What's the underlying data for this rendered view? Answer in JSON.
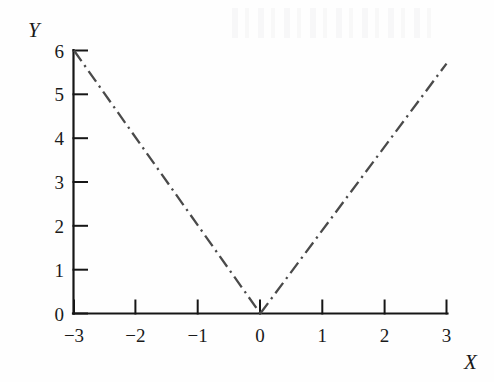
{
  "figure": {
    "background_color": "#fefefe",
    "axis_color": "#161616",
    "line_color": "#4a4a4a",
    "x_axis_title": "X",
    "y_axis_title": "Y"
  },
  "chart_data": {
    "type": "line",
    "title": "",
    "subtitle": "",
    "xlabel": "X",
    "ylabel": "Y",
    "xlim": [
      -3,
      3
    ],
    "ylim": [
      0,
      6
    ],
    "xticks": [
      -3,
      -2,
      -1,
      0,
      1,
      2,
      3
    ],
    "yticks": [
      0,
      1,
      2,
      3,
      4,
      5,
      6
    ],
    "xtick_labels": [
      "−3",
      "−2",
      "−1",
      "0",
      "1",
      "2",
      "3"
    ],
    "ytick_labels": [
      "0",
      "1",
      "2",
      "3",
      "4",
      "5",
      "6"
    ],
    "grid": false,
    "legend": null,
    "tick_direction": "in",
    "spines": [
      "left",
      "bottom"
    ],
    "annotations": [],
    "series": [
      {
        "name": "y = |2x|",
        "linestyle": "dashdot",
        "color": "#4a4a4a",
        "linewidth": 2,
        "x": [
          -3,
          0,
          3
        ],
        "y": [
          6,
          0,
          5.7
        ],
        "points": [
          {
            "x": -3,
            "y": 6
          },
          {
            "x": -2,
            "y": 4
          },
          {
            "x": -1,
            "y": 2
          },
          {
            "x": 0,
            "y": 0
          },
          {
            "x": 1,
            "y": 1.9
          },
          {
            "x": 2,
            "y": 3.8
          },
          {
            "x": 3,
            "y": 5.7
          }
        ]
      }
    ]
  }
}
